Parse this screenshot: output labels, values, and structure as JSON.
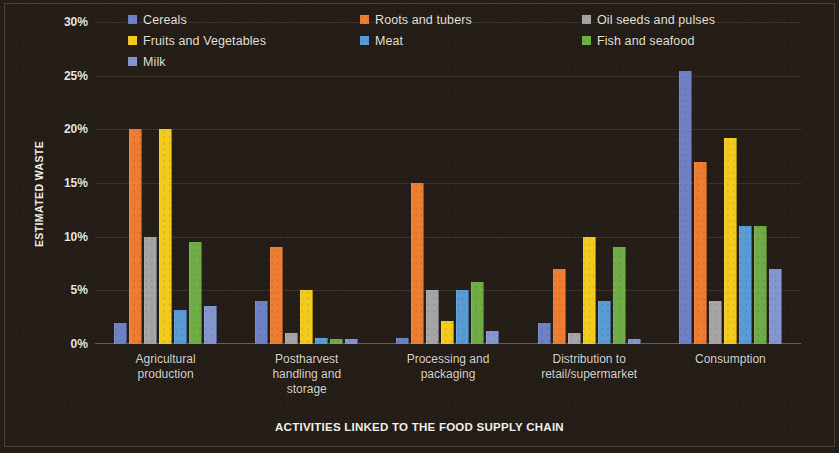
{
  "chart_data": {
    "type": "bar",
    "title": "",
    "xlabel": "ACTIVITIES LINKED TO THE FOOD SUPPLY CHAIN",
    "ylabel": "ESTIMATED WASTE",
    "ylim": [
      0,
      30
    ],
    "ytick_labels": [
      "30%",
      "25%",
      "20%",
      "15%",
      "10%",
      "5%",
      "0%"
    ],
    "ytick_values": [
      30,
      25,
      20,
      15,
      10,
      5,
      0
    ],
    "grid": true,
    "legend_position": "top",
    "value_suffix": "%",
    "categories": [
      "Agricultural production",
      "Postharvest handling and storage",
      "Processing and packaging",
      "Distribution to retail/supermarket",
      "Consumption"
    ],
    "category_lines": [
      [
        "Agricultural",
        "production"
      ],
      [
        "Postharvest",
        "handling and",
        "storage"
      ],
      [
        "Processing and",
        "packaging"
      ],
      [
        "Distribution to",
        "retail/supermarket"
      ],
      [
        "Consumption"
      ]
    ],
    "series": [
      {
        "name": "Cereals",
        "color": "#6e81c4",
        "values": [
          2.0,
          4.0,
          0.6,
          2.0,
          25.4
        ]
      },
      {
        "name": "Roots and tubers",
        "color": "#ed7d31",
        "values": [
          20.0,
          9.0,
          15.0,
          7.0,
          17.0
        ]
      },
      {
        "name": "Oil seeds and pulses",
        "color": "#a5a5a5",
        "values": [
          10.0,
          1.0,
          5.0,
          1.0,
          4.0
        ]
      },
      {
        "name": "Fruits and Vegetables",
        "color": "#f2cb1d",
        "values": [
          20.0,
          5.0,
          2.1,
          10.0,
          19.2
        ]
      },
      {
        "name": "Meat",
        "color": "#5b9bd5",
        "values": [
          3.2,
          0.6,
          5.0,
          4.0,
          11.0
        ]
      },
      {
        "name": "Fish and seafood",
        "color": "#70ad47",
        "values": [
          9.5,
          0.5,
          5.8,
          9.0,
          11.0
        ]
      },
      {
        "name": "Milk",
        "color": "#8495cf",
        "values": [
          3.5,
          0.5,
          1.2,
          0.5,
          7.0
        ]
      }
    ]
  }
}
